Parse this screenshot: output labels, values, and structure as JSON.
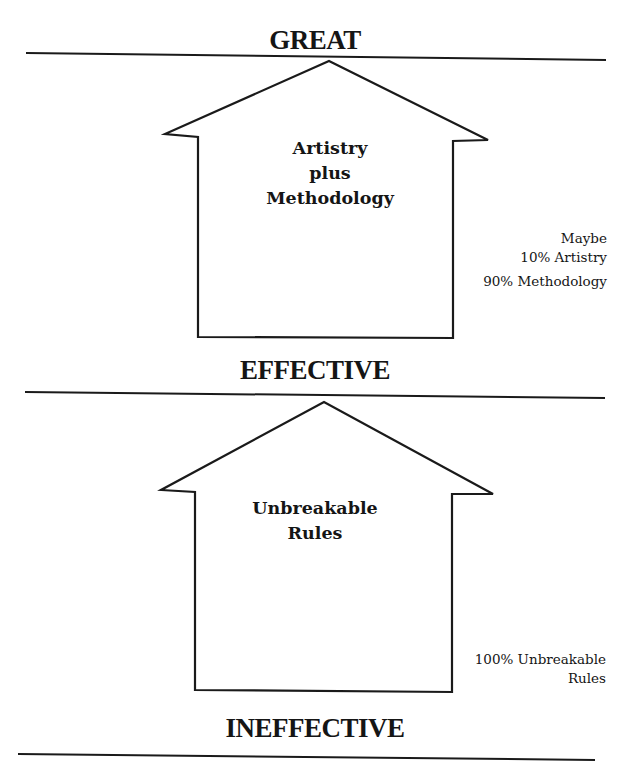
{
  "diagram": {
    "levels": {
      "top": "GREAT",
      "middle": "EFFECTIVE",
      "bottom": "INEFFECTIVE"
    },
    "upper_house": {
      "lines": [
        "Artistry",
        "plus",
        "Methodology"
      ],
      "note": {
        "line1": "Maybe",
        "line2": "10% Artistry",
        "line3": "90% Methodology"
      }
    },
    "lower_house": {
      "lines": [
        "Unbreakable",
        "Rules"
      ],
      "note": {
        "line1": "100% Unbreakable",
        "line2": "Rules"
      }
    },
    "colors": {
      "ink": "#151515",
      "background": "#ffffff"
    }
  }
}
